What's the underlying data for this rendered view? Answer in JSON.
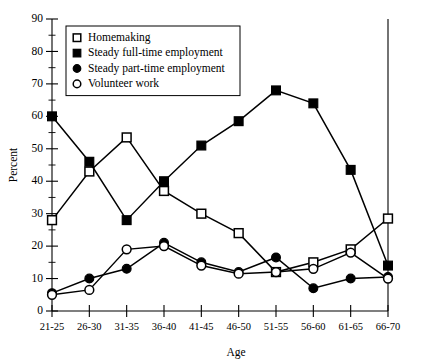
{
  "chart_data": {
    "type": "line",
    "title": "",
    "xlabel": "Age",
    "ylabel": "Percent",
    "ylim": [
      0,
      90
    ],
    "ytick_step": 10,
    "yminor_step": 5,
    "grid": false,
    "legend_position": "top-left",
    "categories": [
      "21-25",
      "26-30",
      "31-35",
      "36-40",
      "41-45",
      "46-50",
      "51-55",
      "56-60",
      "61-65",
      "66-70"
    ],
    "ytick_labels": [
      "0",
      "10",
      "20",
      "30",
      "40",
      "50",
      "60",
      "70",
      "80",
      "90"
    ],
    "series": [
      {
        "name": "Homemaking",
        "marker": "open-square",
        "values": [
          28,
          43,
          53.5,
          37,
          30,
          24,
          12,
          15,
          19,
          28.5
        ]
      },
      {
        "name": "Steady full-time employment",
        "marker": "filled-square",
        "values": [
          60,
          46,
          28,
          40,
          51,
          58.5,
          68,
          64,
          43.5,
          14
        ]
      },
      {
        "name": "Steady part-time employment",
        "marker": "filled-circle",
        "values": [
          5.5,
          10,
          13,
          21,
          15,
          12,
          16.5,
          7,
          10,
          10.5
        ]
      },
      {
        "name": "Volunteer work",
        "marker": "open-circle",
        "values": [
          5,
          6.5,
          19,
          20,
          14,
          11.5,
          12,
          13,
          18,
          10
        ]
      }
    ],
    "colors": {
      "line": "#000000",
      "marker_fill_open": "#ffffff",
      "marker_fill_solid": "#000000",
      "background": "#ffffff"
    }
  },
  "legend": {
    "items": [
      {
        "label": "Homemaking",
        "marker": "open-square"
      },
      {
        "label": "Steady full-time employment",
        "marker": "filled-square"
      },
      {
        "label": "Steady part-time employment",
        "marker": "filled-circle"
      },
      {
        "label": "Volunteer work",
        "marker": "open-circle"
      }
    ]
  }
}
